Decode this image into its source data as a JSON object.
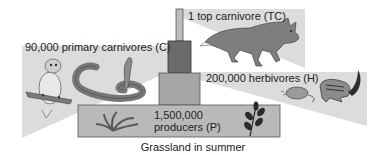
{
  "diagram": {
    "type": "ecological-pyramid-of-numbers",
    "caption": "Grassland in summer",
    "levels": [
      {
        "id": "TC",
        "count": "1",
        "label": "1 top carnivore (TC)",
        "organisms": [
          "fox"
        ]
      },
      {
        "id": "C",
        "count": "90,000",
        "label": "90,000 primary carnivores (C)",
        "organisms": [
          "owl",
          "snake"
        ]
      },
      {
        "id": "H",
        "count": "200,000",
        "label": "200,000 herbivores (H)",
        "organisms": [
          "mouse",
          "chipmunk"
        ]
      },
      {
        "id": "P",
        "count": "1,500,000",
        "label_line1": "1,500,000",
        "label_line2": "producers (P)",
        "organisms": [
          "grass",
          "leafy-plant"
        ]
      }
    ],
    "colors": {
      "wedge": "#d9d9d9",
      "block_tc": "#bdbdbd",
      "block_c": "#6e6e6e",
      "block_h": "#a3a3a3",
      "block_p": "#b8b8b8",
      "animal": "#8a8a8a",
      "animal_dark": "#3a3a3a"
    }
  }
}
